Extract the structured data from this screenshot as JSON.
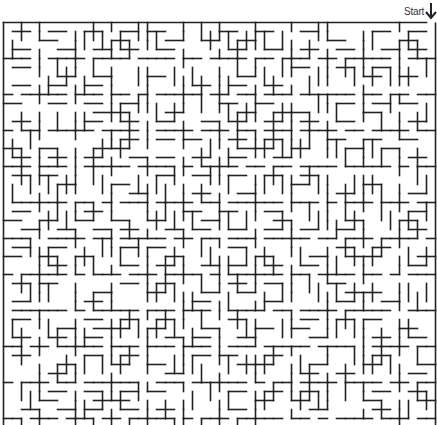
{
  "maze": {
    "start_label": "Start",
    "start_icon": "arrow-down-icon",
    "origin_x": 3.5,
    "origin_y": 22.5,
    "cell_size": 9,
    "block_cells": 4,
    "blocks_x": 12,
    "blocks_y": 12,
    "entrance_col": 47,
    "wall_color": "#222222",
    "wall_width": 1.6,
    "seed": 20240611
  }
}
